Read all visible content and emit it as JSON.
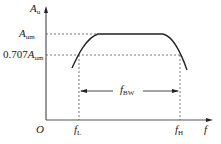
{
  "diagram": {
    "y_axis": {
      "symbol": "A",
      "subscript": "u"
    },
    "x_axis": {
      "symbol": "f"
    },
    "origin": "O",
    "levels": {
      "max": {
        "symbol": "A",
        "subscript": "um"
      },
      "half_power": {
        "prefix": "0.707",
        "symbol": "A",
        "subscript": "um"
      }
    },
    "frequencies": {
      "low": {
        "symbol": "f",
        "subscript": "L"
      },
      "high": {
        "symbol": "f",
        "subscript": "H"
      },
      "bandwidth": {
        "symbol": "f",
        "subscript": "BW"
      }
    },
    "colors": {
      "line": "#222222",
      "dashed": "#444444",
      "background": "#ffffff"
    }
  }
}
